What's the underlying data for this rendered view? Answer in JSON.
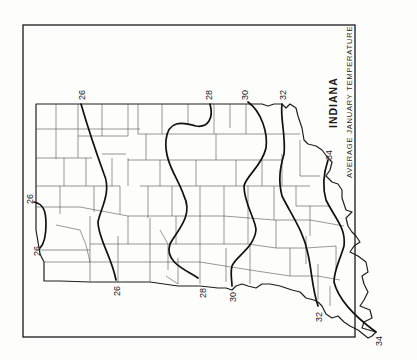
{
  "map": {
    "title": "INDIANA",
    "subtitle": "AVERAGE JANUARY TEMPERATURE",
    "orientation": "rotated 90° counter-clockwise (north at left)",
    "isotherms": [
      {
        "value": "26",
        "label_top": "26",
        "label_bottom": "26"
      },
      {
        "value": "26",
        "label_top": "26",
        "label_bottom": "26",
        "note": "small closed isotherm in northwest corner"
      },
      {
        "value": "28",
        "label_top": "28",
        "label_bottom": "28"
      },
      {
        "value": "30",
        "label_top": "30",
        "label_bottom": "30"
      },
      {
        "value": "32",
        "label_top": "32",
        "label_bottom": "32"
      },
      {
        "value": "34",
        "label_top": "34",
        "label_bottom": "34"
      }
    ],
    "labels": {
      "iso26_nw_top": "26",
      "iso26_nw_bottom": "26",
      "iso26_top": "26",
      "iso26_bottom": "26",
      "iso28_top": "28",
      "iso28_bottom": "28",
      "iso30_top": "30",
      "iso30_bottom": "30",
      "iso32_top": "32",
      "iso32_bottom": "32",
      "iso34_top": "34",
      "iso34_bottom": "34"
    },
    "colors": {
      "background": "#fdfdfb",
      "ink": "#1a1a1a"
    }
  }
}
